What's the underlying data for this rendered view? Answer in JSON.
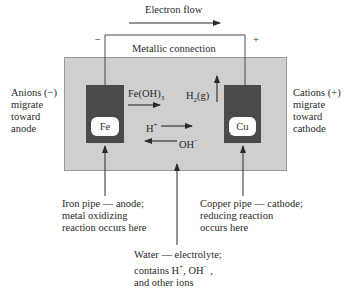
{
  "diagram": {
    "electron_flow": {
      "label": "Electron flow"
    },
    "connection": {
      "label": "Metallic connection",
      "neg_sign": "−",
      "pos_sign": "+"
    },
    "anode": {
      "symbol": "Fe",
      "side_label_lines": [
        "Anions (−)",
        "migrate",
        "toward",
        "anode"
      ],
      "caption_lines": [
        "Iron pipe — anode;",
        "metal oxidizing",
        "reaction occurs here"
      ]
    },
    "cathode": {
      "symbol": "Cu",
      "side_label_lines": [
        "Cations (+)",
        "migrate",
        "toward",
        "cathode"
      ],
      "caption_lines": [
        "Copper pipe — cathode;",
        "reducing reaction",
        "occurs here"
      ]
    },
    "products": {
      "feoh3": {
        "main": "Fe(OH)",
        "sub": "3"
      },
      "h2g": {
        "pre": "H",
        "sub": "2",
        "post": "(g)"
      }
    },
    "ions": {
      "hplus": {
        "base": "H",
        "sup": "+"
      },
      "ohminus": {
        "base": "OH",
        "sup": "−"
      }
    },
    "electrolyte": {
      "caption_line1": "Water — electrolyte;",
      "caption_line2_pre": "contains H",
      "caption_line2_sup1": "+",
      "caption_line2_mid": ", OH",
      "caption_line2_sup2": "−",
      "caption_line2_post": " ,",
      "caption_line3": "and other ions"
    },
    "colors": {
      "electrolyte_fill": "#cfcfcf",
      "electrode_fill": "#4a4a4a",
      "line": "#2a2a2a"
    }
  }
}
